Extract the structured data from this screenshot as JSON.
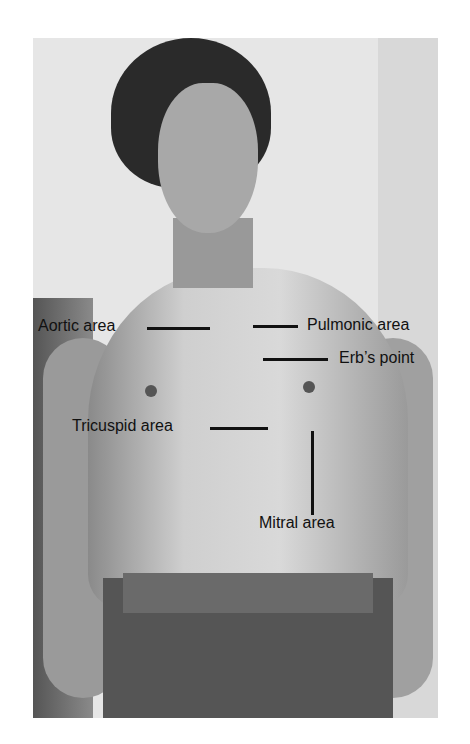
{
  "figure": {
    "labels": [
      {
        "id": "aortic",
        "text": "Aortic area"
      },
      {
        "id": "pulmonic",
        "text": "Pulmonic area"
      },
      {
        "id": "erbs",
        "text": "Erb’s point"
      },
      {
        "id": "tricuspid",
        "text": "Tricuspid area"
      },
      {
        "id": "mitral",
        "text": "Mitral area"
      }
    ]
  }
}
